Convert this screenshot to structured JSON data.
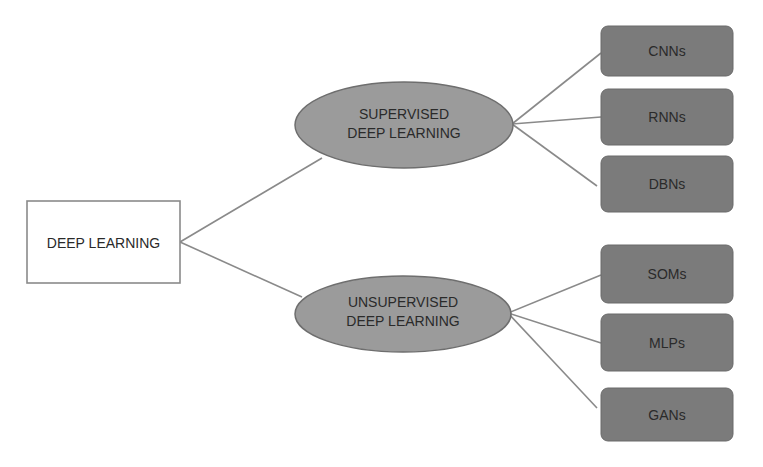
{
  "diagram": {
    "colors": {
      "background": "#ffffff",
      "root_fill": "#ffffff",
      "root_stroke": "#8a8a8a",
      "ellipse_fill": "#9b9b9b",
      "ellipse_stroke": "#6e6e6e",
      "leaf_fill": "#7b7b7b",
      "leaf_stroke": "#6a6a6a",
      "connector": "#8a8a8a",
      "text": "#2a2a2a"
    },
    "root": {
      "label": "DEEP LEARNING"
    },
    "branches": [
      {
        "label_line1": "SUPERVISED",
        "label_line2": "DEEP LEARNING",
        "leaves": [
          {
            "label": "CNNs"
          },
          {
            "label": "RNNs"
          },
          {
            "label": "DBNs"
          }
        ]
      },
      {
        "label_line1": "UNSUPERVISED",
        "label_line2": "DEEP LEARNING",
        "leaves": [
          {
            "label": "SOMs"
          },
          {
            "label": "MLPs"
          },
          {
            "label": "GANs"
          }
        ]
      }
    ]
  }
}
